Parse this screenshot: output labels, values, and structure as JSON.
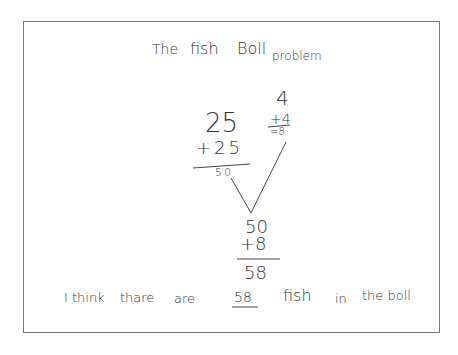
{
  "title": {
    "w1": "The",
    "w2": "fish",
    "w3": "Boll",
    "w4": "problem"
  },
  "left_sum": {
    "top": "25",
    "addend": "+25",
    "result": "50"
  },
  "right_sum": {
    "top": "4",
    "addend": "+4",
    "result": "=8"
  },
  "bottom_sum": {
    "top": "50",
    "addend": "+8",
    "result": "58"
  },
  "answer": {
    "pre1": "I think",
    "pre2": "thare",
    "pre3": "are",
    "number": "58",
    "post1": "fish",
    "post2": "in",
    "post3": "the boll"
  }
}
